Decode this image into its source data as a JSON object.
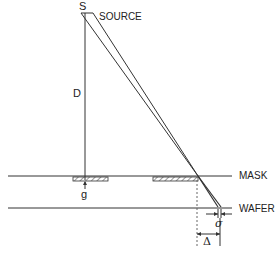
{
  "diagram": {
    "source_point": "S",
    "source_label": "SOURCE",
    "distance_label": "D",
    "gap_label": "g",
    "mask_label": "MASK",
    "wafer_label": "WAFER",
    "penumbra_label": "σ",
    "shadow_offset_label": "Δ",
    "line_color": "#333333",
    "background": "#ffffff"
  }
}
